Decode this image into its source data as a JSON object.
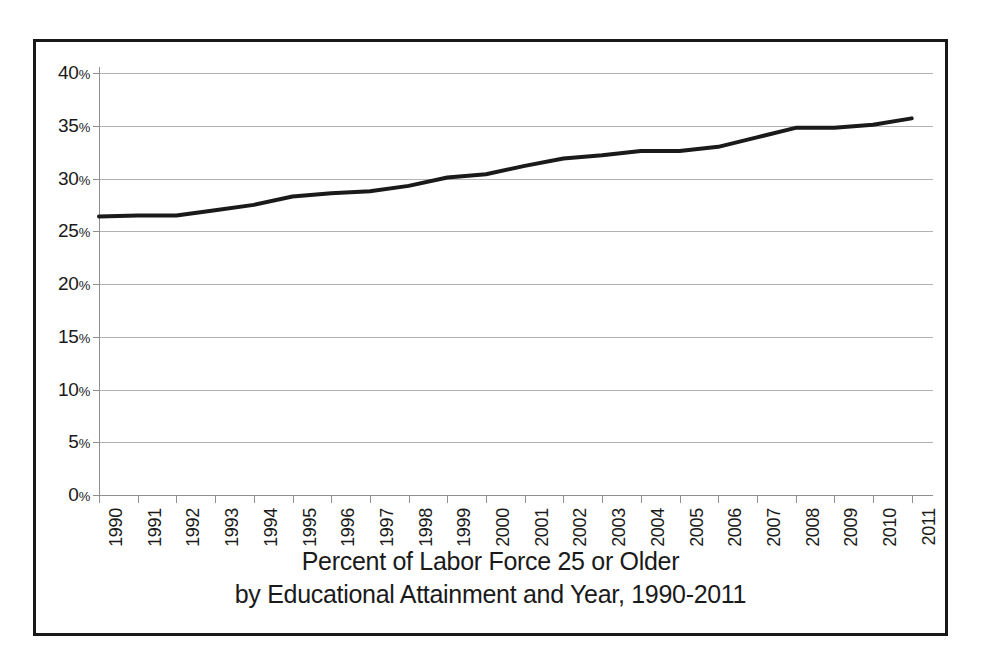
{
  "caption": {
    "line1": "Percent of Labor Force 25 or Older",
    "line2": "by Educational Attainment and Year, 1990-2011"
  },
  "axis": {
    "y_tick_labels": [
      "40",
      "35",
      "30",
      "25",
      "20",
      "15",
      "10",
      "5",
      "0"
    ],
    "y_unit": "%"
  },
  "chart_data": {
    "type": "line",
    "title": "Percent of Labor Force 25 or Older by Educational Attainment and Year, 1990-2011",
    "xlabel": "",
    "ylabel": "",
    "ylim": [
      0,
      40
    ],
    "yticks": [
      0,
      5,
      10,
      15,
      20,
      25,
      30,
      35,
      40
    ],
    "ytick_labels": [
      "0%",
      "5%",
      "10%",
      "15%",
      "20%",
      "25%",
      "30%",
      "35%",
      "40%"
    ],
    "grid": true,
    "legend": "none",
    "categories": [
      "1990",
      "1991",
      "1992",
      "1993",
      "1994",
      "1995",
      "1996",
      "1997",
      "1998",
      "1999",
      "2000",
      "2001",
      "2002",
      "2003",
      "2004",
      "2005",
      "2006",
      "2007",
      "2008",
      "2009",
      "2010",
      "2011"
    ],
    "series": [
      {
        "name": "Percent of labor force 25 or older",
        "color": "#1a1a1a",
        "values": [
          26.4,
          26.5,
          26.5,
          27.0,
          27.5,
          28.3,
          28.6,
          28.8,
          29.3,
          30.1,
          30.4,
          31.2,
          31.9,
          32.2,
          32.6,
          32.6,
          33.0,
          33.9,
          34.8,
          34.8,
          35.1,
          35.7
        ]
      }
    ]
  }
}
